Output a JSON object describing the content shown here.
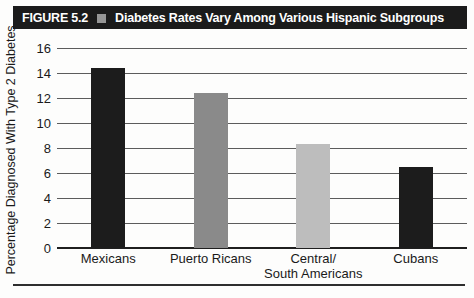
{
  "figure_header": {
    "label": "FIGURE 5.2",
    "separator_icon": "square-bullet",
    "title": "Diabetes Rates Vary Among Various Hispanic Subgroups"
  },
  "chart_data": {
    "type": "bar",
    "title": "Diabetes Rates Vary Among Various Hispanic Subgroups",
    "categories": [
      "Mexicans",
      "Puerto Ricans",
      "Central/\nSouth Americans",
      "Cubans"
    ],
    "values": [
      14.4,
      12.4,
      8.3,
      6.5
    ],
    "bar_colors": [
      "#1c1c1c",
      "#8a8a8a",
      "#bdbdbd",
      "#1c1c1c"
    ],
    "xlabel": "",
    "ylabel": "Percentage Diagnosed With Type 2 Diabetes",
    "ylim": [
      0,
      16
    ],
    "yticks": [
      0,
      2,
      4,
      6,
      8,
      10,
      12,
      14,
      16
    ],
    "grid": "horizontal",
    "legend": "none"
  },
  "colors": {
    "header_bg": "#1b1b1b",
    "header_text": "#ffffff",
    "header_square": "#969696",
    "gridline": "#5c5c5c",
    "axis_line": "#1f1f1f",
    "rule": "#2e2e2e",
    "page_bg": "#fdfdfc"
  }
}
